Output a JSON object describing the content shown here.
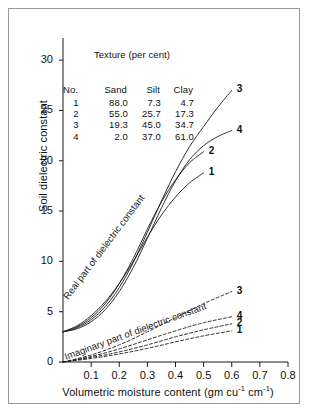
{
  "chart_data": {
    "type": "line",
    "title": "",
    "xlabel": "Volumetric moisture content (gm cu⁻¹ cm⁻¹)",
    "ylabel": "Soil dielectric constant",
    "xlim": [
      0,
      0.8
    ],
    "ylim": [
      0,
      32
    ],
    "xticks": [
      "0.1",
      "0.2",
      "0.3",
      "0.4",
      "0.5",
      "0.6",
      "0.7",
      "0.8"
    ],
    "xtick_values": [
      0.1,
      0.2,
      0.3,
      0.4,
      0.5,
      0.6,
      0.7,
      0.8
    ],
    "yticks": [
      "0",
      "5",
      "10",
      "15",
      "20",
      "25",
      "30"
    ],
    "ytick_values": [
      0,
      5,
      10,
      15,
      20,
      25,
      30
    ],
    "grid": false,
    "legend_position": "curve-end-labels",
    "annotations": [
      {
        "text": "Real part of dielectric constant",
        "rotated": true
      },
      {
        "text": "Imaginary part of dielectric constant",
        "rotated": true
      }
    ],
    "series": [
      {
        "name": "1",
        "part": "real",
        "style": "solid",
        "x": [
          0.0,
          0.05,
          0.1,
          0.15,
          0.2,
          0.25,
          0.3,
          0.35,
          0.4,
          0.45,
          0.5
        ],
        "y": [
          3.0,
          3.6,
          4.6,
          6.0,
          7.8,
          10.0,
          12.4,
          14.6,
          16.4,
          17.8,
          18.8
        ]
      },
      {
        "name": "2",
        "part": "real",
        "style": "solid",
        "x": [
          0.0,
          0.05,
          0.1,
          0.15,
          0.2,
          0.25,
          0.3,
          0.35,
          0.4,
          0.45,
          0.5
        ],
        "y": [
          3.0,
          3.5,
          4.4,
          5.8,
          7.8,
          10.3,
          13.2,
          15.9,
          18.1,
          19.8,
          20.9
        ]
      },
      {
        "name": "3",
        "part": "real",
        "style": "solid",
        "x": [
          0.0,
          0.05,
          0.1,
          0.15,
          0.2,
          0.25,
          0.3,
          0.35,
          0.4,
          0.45,
          0.5,
          0.55,
          0.6
        ],
        "y": [
          3.0,
          3.4,
          4.2,
          5.5,
          7.4,
          9.9,
          12.9,
          16.0,
          18.9,
          21.4,
          23.4,
          25.3,
          27.0
        ]
      },
      {
        "name": "4",
        "part": "real",
        "style": "solid",
        "x": [
          0.0,
          0.05,
          0.1,
          0.15,
          0.2,
          0.25,
          0.3,
          0.35,
          0.4,
          0.45,
          0.5,
          0.55,
          0.6
        ],
        "y": [
          3.0,
          3.3,
          4.0,
          5.2,
          7.0,
          9.4,
          12.3,
          15.3,
          18.0,
          20.1,
          21.5,
          22.4,
          23.0
        ]
      },
      {
        "name": "1",
        "part": "imaginary",
        "style": "dashed",
        "x": [
          0.0,
          0.1,
          0.2,
          0.3,
          0.4,
          0.5,
          0.6
        ],
        "y": [
          0.0,
          0.35,
          0.8,
          1.35,
          2.0,
          2.6,
          3.1
        ]
      },
      {
        "name": "2",
        "part": "imaginary",
        "style": "dashed",
        "x": [
          0.0,
          0.1,
          0.2,
          0.3,
          0.4,
          0.5,
          0.6
        ],
        "y": [
          0.0,
          0.45,
          1.0,
          1.7,
          2.5,
          3.2,
          3.8
        ]
      },
      {
        "name": "3",
        "part": "imaginary",
        "style": "dashed",
        "x": [
          0.0,
          0.1,
          0.2,
          0.3,
          0.4,
          0.5,
          0.6
        ],
        "y": [
          0.0,
          0.7,
          1.7,
          3.0,
          4.4,
          5.8,
          7.0
        ]
      },
      {
        "name": "4",
        "part": "imaginary",
        "style": "dashed",
        "x": [
          0.0,
          0.1,
          0.2,
          0.3,
          0.4,
          0.5,
          0.6
        ],
        "y": [
          0.0,
          0.55,
          1.3,
          2.2,
          3.1,
          3.9,
          4.5
        ]
      }
    ],
    "curve_end_labels": [
      {
        "label": "3",
        "part": "real"
      },
      {
        "label": "4",
        "part": "real"
      },
      {
        "label": "2",
        "part": "real"
      },
      {
        "label": "1",
        "part": "real"
      },
      {
        "label": "3",
        "part": "imaginary"
      },
      {
        "label": "4",
        "part": "imaginary"
      },
      {
        "label": "2",
        "part": "imaginary"
      },
      {
        "label": "1",
        "part": "imaginary"
      }
    ]
  },
  "texture_table": {
    "title": "Texture (per cent)",
    "columns": [
      "No.",
      "Sand",
      "Silt",
      "Clay"
    ],
    "rows": [
      {
        "no": "1",
        "sand": "88.0",
        "silt": "7.3",
        "clay": "4.7"
      },
      {
        "no": "2",
        "sand": "55.0",
        "silt": "25.7",
        "clay": "17.3"
      },
      {
        "no": "3",
        "sand": "19.3",
        "silt": "45.0",
        "clay": "34.7"
      },
      {
        "no": "4",
        "sand": "2.0",
        "silt": "37.0",
        "clay": "61.0"
      }
    ]
  },
  "axis_label_html": {
    "x_prefix": "Volumetric moisture content (gm cu",
    "x_sup1": "-1",
    "x_mid": " cm",
    "x_sup2": "-1",
    "x_suffix": ")"
  },
  "colors": {
    "line": "#1a1a1a",
    "frame": "#9a9a9a",
    "background": "#ffffff"
  }
}
